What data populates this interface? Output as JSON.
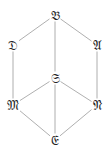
{
  "diagram": {
    "type": "lattice",
    "line_color": "#9a9a9a",
    "text_color": "#222222",
    "nodes": [
      {
        "id": "B",
        "label": "𝔅",
        "x": 55,
        "y": 15
      },
      {
        "id": "D",
        "label": "𝔇",
        "x": 13,
        "y": 45
      },
      {
        "id": "A",
        "label": "𝔄",
        "x": 97,
        "y": 45
      },
      {
        "id": "S",
        "label": "𝔖",
        "x": 55,
        "y": 78
      },
      {
        "id": "M",
        "label": "𝔐",
        "x": 13,
        "y": 105
      },
      {
        "id": "N",
        "label": "𝔑",
        "x": 97,
        "y": 105
      },
      {
        "id": "E",
        "label": "𝔈",
        "x": 55,
        "y": 140
      }
    ],
    "edges": [
      [
        "B",
        "D"
      ],
      [
        "B",
        "A"
      ],
      [
        "B",
        "S"
      ],
      [
        "D",
        "M"
      ],
      [
        "A",
        "N"
      ],
      [
        "S",
        "M"
      ],
      [
        "S",
        "N"
      ],
      [
        "S",
        "E"
      ],
      [
        "M",
        "E"
      ],
      [
        "N",
        "E"
      ]
    ]
  }
}
